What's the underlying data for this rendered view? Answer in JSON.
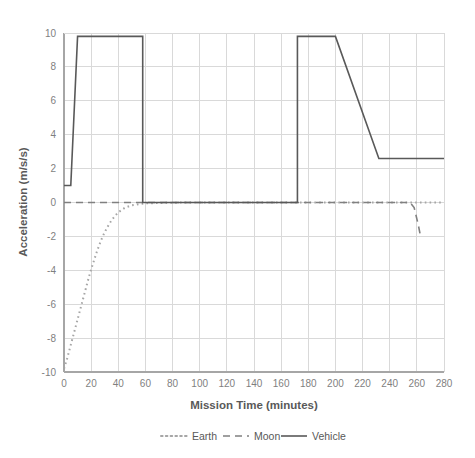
{
  "chart_data": {
    "type": "line",
    "title": "",
    "xlabel": "Mission Time (minutes)",
    "ylabel": "Acceleration (m/s/s)",
    "xlim": [
      0,
      280
    ],
    "ylim": [
      -10,
      10
    ],
    "xticks": [
      0,
      20,
      40,
      60,
      80,
      100,
      120,
      140,
      160,
      180,
      200,
      220,
      240,
      260,
      280
    ],
    "yticks": [
      -10,
      -8,
      -6,
      -4,
      -2,
      0,
      2,
      4,
      6,
      8,
      10
    ],
    "grid": true,
    "legend_position": "bottom",
    "series": [
      {
        "name": "Earth",
        "style": "dotted",
        "color": "#a6a6a6",
        "x": [
          0,
          2,
          4,
          6,
          8,
          10,
          12,
          14,
          16,
          18,
          20,
          22,
          24,
          26,
          28,
          30,
          32,
          34,
          36,
          38,
          40,
          45,
          50,
          60,
          80,
          100,
          120,
          140,
          160,
          180,
          200,
          220,
          240,
          260,
          280
        ],
        "y": [
          -9.8,
          -9.3,
          -8.7,
          -8.1,
          -7.5,
          -6.9,
          -6.3,
          -5.7,
          -5.1,
          -4.5,
          -3.95,
          -3.45,
          -2.95,
          -2.5,
          -2.1,
          -1.75,
          -1.45,
          -1.18,
          -0.95,
          -0.75,
          -0.58,
          -0.3,
          -0.16,
          -0.05,
          -0.01,
          0,
          0,
          0,
          0,
          0,
          0,
          0,
          0,
          0,
          0
        ]
      },
      {
        "name": "Moon",
        "style": "dashed",
        "color": "#808080",
        "x": [
          0,
          20,
          40,
          60,
          80,
          100,
          120,
          140,
          160,
          180,
          200,
          220,
          240,
          255,
          258,
          261,
          263
        ],
        "y": [
          0,
          0,
          0,
          0,
          0,
          0,
          0,
          0,
          0,
          0,
          0,
          0,
          0,
          0,
          -0.3,
          -1.3,
          -2.1
        ]
      },
      {
        "name": "Vehicle",
        "style": "solid",
        "color": "#595959",
        "x": [
          0,
          5,
          10,
          58,
          58,
          172,
          172,
          200,
          232,
          280
        ],
        "y": [
          1.0,
          1.0,
          9.8,
          9.8,
          0,
          0,
          9.8,
          9.8,
          2.6,
          2.6
        ]
      }
    ]
  },
  "legend": {
    "items": [
      {
        "label": "Earth"
      },
      {
        "label": "Moon"
      },
      {
        "label": "Vehicle"
      }
    ]
  }
}
